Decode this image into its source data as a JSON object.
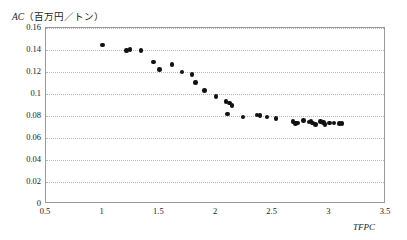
{
  "chart_data": {
    "type": "scatter",
    "title": "",
    "xlabel": "TFPC",
    "ylabel": "AC（百万円／トン）",
    "ylabel_italic_part": "AC",
    "ylabel_rest": "（百万円／トン）",
    "xlim": [
      0.5,
      3.5
    ],
    "ylim": [
      0,
      0.16
    ],
    "xticks": [
      "0.5",
      "1",
      "1.5",
      "2",
      "2.5",
      "3",
      "3.5"
    ],
    "xtick_values": [
      0.5,
      1,
      1.5,
      2,
      2.5,
      3,
      3.5
    ],
    "yticks": [
      "0",
      "0.02",
      "0.04",
      "0.06",
      "0.08",
      "0.1",
      "0.12",
      "0.14",
      "0.16"
    ],
    "ytick_values": [
      0,
      0.02,
      0.04,
      0.06,
      0.08,
      0.1,
      0.12,
      0.14,
      0.16
    ],
    "grid": true,
    "grid_axis": "y",
    "legend": null,
    "marker": "circle",
    "marker_color": "#111111",
    "points": [
      {
        "x": 1.0,
        "y": 0.1445
      },
      {
        "x": 1.21,
        "y": 0.1395
      },
      {
        "x": 1.24,
        "y": 0.1405
      },
      {
        "x": 1.34,
        "y": 0.1395
      },
      {
        "x": 1.45,
        "y": 0.129
      },
      {
        "x": 1.5,
        "y": 0.1225
      },
      {
        "x": 1.61,
        "y": 0.1268
      },
      {
        "x": 1.7,
        "y": 0.12
      },
      {
        "x": 1.79,
        "y": 0.1175
      },
      {
        "x": 1.82,
        "y": 0.1105
      },
      {
        "x": 1.9,
        "y": 0.103
      },
      {
        "x": 2.0,
        "y": 0.0975
      },
      {
        "x": 2.09,
        "y": 0.093
      },
      {
        "x": 2.12,
        "y": 0.092
      },
      {
        "x": 2.14,
        "y": 0.0895
      },
      {
        "x": 2.1,
        "y": 0.082
      },
      {
        "x": 2.24,
        "y": 0.0792
      },
      {
        "x": 2.36,
        "y": 0.081
      },
      {
        "x": 2.39,
        "y": 0.0805
      },
      {
        "x": 2.45,
        "y": 0.079
      },
      {
        "x": 2.53,
        "y": 0.0775
      },
      {
        "x": 2.68,
        "y": 0.0748
      },
      {
        "x": 2.7,
        "y": 0.073
      },
      {
        "x": 2.72,
        "y": 0.0738
      },
      {
        "x": 2.77,
        "y": 0.076
      },
      {
        "x": 2.82,
        "y": 0.0745
      },
      {
        "x": 2.84,
        "y": 0.0755
      },
      {
        "x": 2.85,
        "y": 0.0735
      },
      {
        "x": 2.88,
        "y": 0.0722
      },
      {
        "x": 2.92,
        "y": 0.0748
      },
      {
        "x": 2.95,
        "y": 0.074
      },
      {
        "x": 2.96,
        "y": 0.0722
      },
      {
        "x": 3.0,
        "y": 0.0735
      },
      {
        "x": 3.04,
        "y": 0.0738
      },
      {
        "x": 3.09,
        "y": 0.0732
      },
      {
        "x": 3.11,
        "y": 0.0733
      }
    ]
  },
  "axes": {
    "frame_color": "#9a9a9a",
    "grid_color": "#b9b9b9",
    "background": "#ffffff"
  }
}
